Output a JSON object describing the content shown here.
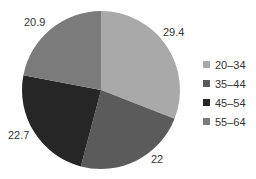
{
  "chart_data": {
    "type": "pie",
    "title": "",
    "categories": [
      "20–34",
      "35–44",
      "45–54",
      "55–64"
    ],
    "values": [
      29.4,
      22,
      22.7,
      20.9
    ],
    "labels": [
      "29.4",
      "22",
      "22.7",
      "20.9"
    ],
    "colors": [
      "#a9a9a9",
      "#5b5b5b",
      "#262626",
      "#7b7b7b"
    ],
    "start_angle": "12 o'clock",
    "direction": "clockwise",
    "legend_position": "right"
  },
  "legend": {
    "items": [
      {
        "label": "20–34",
        "color": "#a9a9a9"
      },
      {
        "label": "35–44",
        "color": "#5b5b5b"
      },
      {
        "label": "45–54",
        "color": "#262626"
      },
      {
        "label": "55–64",
        "color": "#7b7b7b"
      }
    ]
  }
}
